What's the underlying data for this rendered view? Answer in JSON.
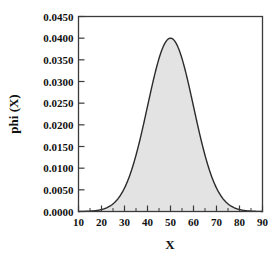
{
  "chart_data": {
    "type": "area",
    "title": "",
    "subtitle": "",
    "xlabel": "X",
    "ylabel": "phi (X)",
    "xlim": [
      10,
      90
    ],
    "ylim": [
      0.0,
      0.045
    ],
    "grid": false,
    "legend": null,
    "annotations": [],
    "style": {
      "fill_color": "#e3e3e3",
      "line_color": "#2b2b2b",
      "frame_color": "#3a3a3a",
      "background": "#ffffff"
    },
    "distribution": {
      "name": "normal",
      "mean": 50,
      "sigma": 10,
      "peak_value": 0.04
    },
    "x_ticks": [
      10,
      20,
      30,
      40,
      50,
      60,
      70,
      80,
      90
    ],
    "x_tick_labels": [
      "10",
      "20",
      "30",
      "40",
      "50",
      "60",
      "70",
      "80",
      "90"
    ],
    "x_minor_step": 5,
    "y_ticks": [
      0.0,
      0.005,
      0.01,
      0.015,
      0.02,
      0.025,
      0.03,
      0.035,
      0.04,
      0.045
    ],
    "y_tick_labels": [
      "0.0000",
      "0.0050",
      "0.0100",
      "0.0150",
      "0.0200",
      "0.0250",
      "0.0300",
      "0.0350",
      "0.0400",
      "0.0450"
    ],
    "x": [
      10,
      12,
      14,
      16,
      18,
      20,
      22,
      24,
      26,
      28,
      30,
      32,
      34,
      36,
      38,
      40,
      42,
      44,
      46,
      48,
      50,
      52,
      54,
      56,
      58,
      60,
      62,
      64,
      66,
      68,
      70,
      72,
      74,
      76,
      78,
      80,
      82,
      84,
      86,
      88,
      90
    ],
    "values": [
      0.0,
      1e-05,
      2e-05,
      4e-05,
      9e-05,
      0.00018,
      0.00034,
      0.00061,
      0.00105,
      0.00171,
      0.00266,
      0.00395,
      0.0056,
      0.0076,
      0.00985,
      0.0122,
      0.01446,
      0.01638,
      0.01771,
      0.01832,
      0.01995,
      0.01832,
      0.01771,
      0.01638,
      0.01446,
      0.0122,
      0.00985,
      0.0076,
      0.0056,
      0.00395,
      0.00266,
      0.00171,
      0.00105,
      0.00061,
      0.00034,
      0.00018,
      9e-05,
      4e-05,
      2e-05,
      1e-05,
      0.0
    ]
  }
}
